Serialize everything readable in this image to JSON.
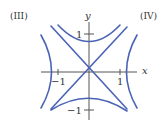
{
  "panels": {
    "left_label": "(III)",
    "right_label": "(IV)"
  },
  "axes": {
    "x_label": "x",
    "y_label": "y",
    "ticks": {
      "x_pos": "1",
      "x_neg": "−1",
      "y_pos": "1",
      "y_neg": "−1"
    }
  },
  "curves": {
    "color": "#4a63b5",
    "description": "Level curves of x^2 - y^2 = c: hyperbolas opening left/right and up/down with asymptotes y = x and y = -x"
  }
}
